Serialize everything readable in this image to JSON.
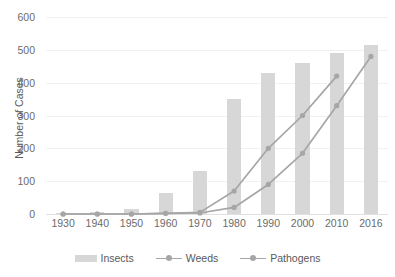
{
  "chart_data": {
    "type": "bar",
    "title": "",
    "subtitle": "",
    "xlabel": "",
    "ylabel": "Number of Cases",
    "categories": [
      "1930",
      "1940",
      "1950",
      "1960",
      "1970",
      "1980",
      "1990",
      "2000",
      "2010",
      "2016"
    ],
    "ylim": [
      0,
      600
    ],
    "yticks": [
      0,
      100,
      200,
      300,
      400,
      500,
      600
    ],
    "ytick_labels": [
      "0",
      "100",
      "200",
      "300",
      "400",
      "500",
      "600"
    ],
    "grid": "horizontal",
    "legend_position": "bottom-center",
    "series": [
      {
        "name": "Insects",
        "render": "bar",
        "color": "#d7d7d7",
        "values": [
          3,
          5,
          15,
          65,
          130,
          350,
          430,
          460,
          490,
          515
        ]
      },
      {
        "name": "Weeds",
        "render": "line",
        "color": "#a6a6a6",
        "values": [
          0,
          0,
          0,
          2,
          5,
          70,
          200,
          300,
          420,
          null
        ]
      },
      {
        "name": "Pathogens",
        "render": "line",
        "color": "#a6a6a6",
        "values": [
          0,
          0,
          0,
          2,
          3,
          20,
          90,
          185,
          330,
          480
        ]
      }
    ]
  },
  "legend": {
    "items": [
      {
        "label": "Insects",
        "marker": "bar-swatch"
      },
      {
        "label": "Weeds",
        "marker": "line-marker"
      },
      {
        "label": "Pathogens",
        "marker": "line-marker"
      }
    ]
  }
}
